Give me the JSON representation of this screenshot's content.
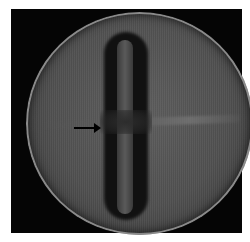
{
  "image": {
    "description": "Grayscale micrograph of a circular disc containing a vertical elongated rod-shaped object constricted at its middle, with a horizontal streak across the center",
    "annotations": [
      {
        "type": "arrow",
        "direction": "right",
        "color": "#000000",
        "points_to": "constriction at center of rod"
      }
    ],
    "colors": {
      "background": "#ffffff",
      "frame": "#050505",
      "disc": "#555555",
      "rod_halo": "#111111"
    }
  }
}
